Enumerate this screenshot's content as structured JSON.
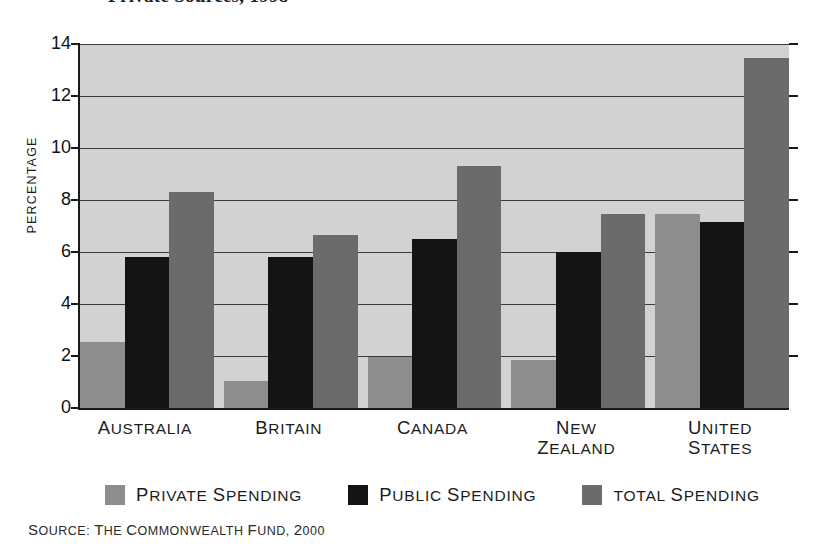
{
  "title": {
    "text": "Private Sources, 1998",
    "note": "cropped-at-top"
  },
  "chart_data": {
    "type": "bar",
    "title": "Private Sources, 1998",
    "xlabel": "",
    "ylabel": "PERCENTAGE",
    "ylim": [
      0,
      14
    ],
    "ytick_step": 2,
    "yticks": [
      0,
      2,
      4,
      6,
      8,
      10,
      12,
      14
    ],
    "ytick_labels": [
      "0",
      "2",
      "4",
      "6",
      "8",
      "10",
      "12",
      "14"
    ],
    "grid": true,
    "legend_position": "bottom",
    "categories": [
      "AUSTRALIA",
      "BRITAIN",
      "CANADA",
      "NEW ZEALAND",
      "UNITED STATES"
    ],
    "category_lines": [
      [
        "AUSTRALIA"
      ],
      [
        "BRITAIN"
      ],
      [
        "CANADA"
      ],
      [
        "NEW",
        "ZEALAND"
      ],
      [
        "UNITED",
        "STATES"
      ]
    ],
    "series": [
      {
        "name": "PRIVATE SPENDING",
        "color": "#8d8d8d",
        "values": [
          2.55,
          1.05,
          1.95,
          1.85,
          7.45
        ]
      },
      {
        "name": "PUBLIC SPENDING",
        "color": "#141414",
        "values": [
          5.8,
          5.8,
          6.5,
          6.0,
          7.15
        ]
      },
      {
        "name": "TOTAL SPENDING",
        "color": "#6b6b6b",
        "values": [
          8.3,
          6.65,
          9.3,
          7.45,
          13.45
        ]
      }
    ]
  },
  "legend": [
    {
      "label": "PRIVATE SPENDING",
      "color": "#8d8d8d",
      "swatch": "legend-swatch-private"
    },
    {
      "label": "PUBLIC SPENDING",
      "color": "#141414",
      "swatch": "legend-swatch-public"
    },
    {
      "label": "TOTAL SPENDING",
      "color": "#6b6b6b",
      "swatch": "legend-swatch-total"
    }
  ],
  "source": {
    "text": "SOURCE: THE COMMONWEALTH FUND, 2000"
  },
  "colors": {
    "plot_background": "#d2d2d2",
    "axis": "#1a1a1a",
    "gridline": "#3a3a3a",
    "page_background": "#ffffff"
  }
}
